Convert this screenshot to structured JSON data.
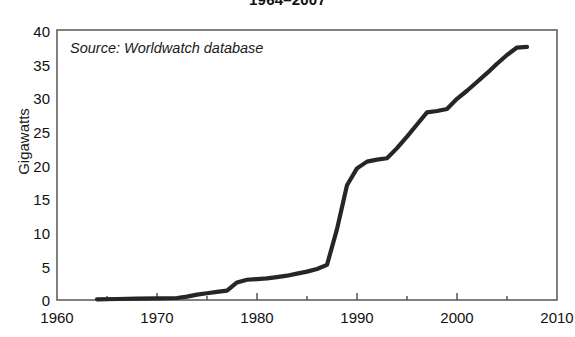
{
  "chart_data": {
    "type": "line",
    "title": "1964–2007",
    "xlabel": "",
    "ylabel": "Gigawatts",
    "xlim": [
      1960,
      2010
    ],
    "ylim": [
      0,
      40
    ],
    "grid": false,
    "legend": null,
    "annotations": [
      {
        "name": "source-note",
        "text": "Source: Worldwatch database"
      }
    ],
    "xticks": [
      1960,
      1970,
      1980,
      1990,
      2000,
      2010
    ],
    "xtick_labels": [
      "1960",
      "1970",
      "1980",
      "1990",
      "2000",
      "2010"
    ],
    "xminor_ticks": [
      1965,
      1975,
      1985,
      1995,
      2005
    ],
    "yticks": [
      0,
      5,
      10,
      15,
      20,
      25,
      30,
      35,
      40
    ],
    "ytick_labels": [
      "0",
      "5",
      "10",
      "15",
      "20",
      "25",
      "30",
      "35",
      "40"
    ],
    "line_color": "#262626",
    "line_width": 4.2,
    "series": [
      {
        "name": "Cumulative installed capacity",
        "x": [
          1964,
          1966,
          1968,
          1970,
          1972,
          1973,
          1974,
          1975,
          1976,
          1977,
          1978,
          1979,
          1980,
          1981,
          1982,
          1983,
          1984,
          1985,
          1986,
          1987,
          1988,
          1989,
          1990,
          1991,
          1992,
          1993,
          1994,
          1995,
          1996,
          1997,
          1998,
          1999,
          2000,
          2001,
          2002,
          2003,
          2004,
          2005,
          2006,
          2007
        ],
        "y": [
          0.1,
          0.15,
          0.2,
          0.25,
          0.3,
          0.5,
          0.8,
          1.0,
          1.2,
          1.4,
          2.6,
          3.0,
          3.1,
          3.2,
          3.4,
          3.6,
          3.9,
          4.2,
          4.6,
          5.2,
          10.5,
          17.0,
          19.5,
          20.5,
          20.8,
          21.0,
          22.5,
          24.2,
          26.0,
          27.8,
          28.0,
          28.3,
          29.8,
          31.0,
          32.3,
          33.6,
          35.0,
          36.3,
          37.4,
          37.5
        ]
      }
    ]
  },
  "axes": {
    "ylabel": "Gigawatts"
  }
}
